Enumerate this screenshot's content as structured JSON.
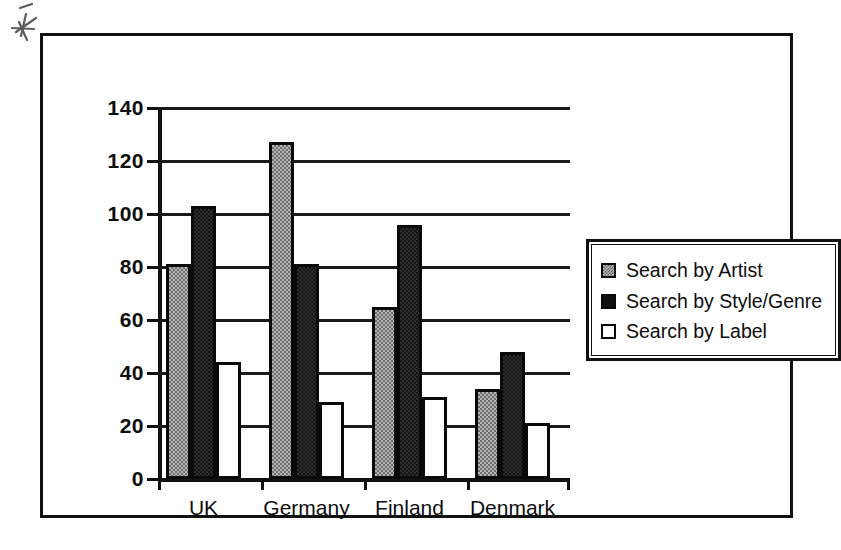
{
  "chart_data": {
    "type": "bar",
    "title": "",
    "xlabel": "",
    "ylabel": "",
    "categories": [
      "UK",
      "Germany",
      "Finland",
      "Denmark"
    ],
    "series": [
      {
        "name": "Search by Artist",
        "key": "s-artist",
        "swatch": "gray-dither",
        "values": [
          81,
          127,
          65,
          34
        ]
      },
      {
        "name": "Search by Style/Genre",
        "key": "s-style",
        "swatch": "solid-black",
        "values": [
          103,
          81,
          96,
          48
        ]
      },
      {
        "name": "Search by Label",
        "key": "s-label",
        "swatch": "white-square",
        "values": [
          44,
          29,
          31,
          21
        ]
      }
    ],
    "ylim": [
      0,
      140
    ],
    "yticks": [
      0,
      20,
      40,
      60,
      80,
      100,
      120,
      140
    ],
    "ytick_labels": [
      "0",
      "20",
      "40",
      "60",
      "80",
      "100",
      "120",
      "140"
    ],
    "grid": true,
    "legend_position": "right",
    "colors": {
      "artist": "#b6b6b6",
      "style_genre": "#141414",
      "label": "#ffffff",
      "outline": "#0a0a0a",
      "gridline": "#1a1a1a",
      "axis": "#111111",
      "background": "#ffffff"
    }
  },
  "figure": {
    "frame_border_color": "#111111",
    "artifact_name": "scan-mark"
  }
}
